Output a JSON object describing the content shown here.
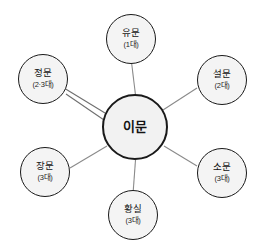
{
  "diagram": {
    "type": "radial-hub-and-spoke",
    "center": {
      "id": "center-imun",
      "label": "이문",
      "sub": ""
    },
    "satellites": [
      {
        "id": "yumun",
        "label": "유문",
        "sub": "(1대)",
        "position": "top",
        "edges": 1
      },
      {
        "id": "seolmun",
        "label": "설문",
        "sub": "(2대)",
        "position": "top-right",
        "edges": 1
      },
      {
        "id": "somun",
        "label": "소문",
        "sub": "(3대)",
        "position": "bottom-right",
        "edges": 1
      },
      {
        "id": "hwangsil",
        "label": "황실",
        "sub": "(3대)",
        "position": "bottom",
        "edges": 1
      },
      {
        "id": "jangmun",
        "label": "장문",
        "sub": "(3대)",
        "position": "bottom-left",
        "edges": 1
      },
      {
        "id": "jeongmun",
        "label": "정문",
        "sub": "(2·3대)",
        "position": "top-left",
        "edges": 2
      }
    ],
    "colors": {
      "node_fill": "#f4f4f4",
      "node_stroke": "#1a1a1a",
      "edge_stroke": "#8a8a8a",
      "background": "#ffffff",
      "text": "#141414"
    }
  }
}
